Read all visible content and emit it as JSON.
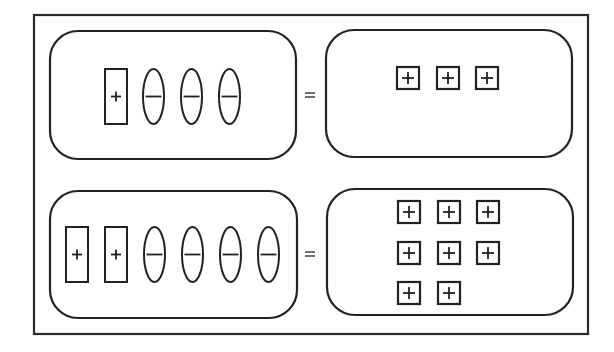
{
  "diagram": {
    "title": "",
    "colors": {
      "stroke": "#222222",
      "background": "#ffffff",
      "frame": "#2a2a2a"
    },
    "equals_symbol": "=",
    "frame": {
      "x": 34,
      "y": 15,
      "w": 554,
      "h": 319
    },
    "rows": [
      {
        "id": "row-1",
        "equation": "(+1) + (-1) + (-1) + (-1) = 3 units",
        "left_panel": {
          "x": 50,
          "y": 31,
          "w": 246,
          "h": 128,
          "r": 28
        },
        "equals": {
          "x": 310,
          "y": 95
        },
        "right_panel": {
          "x": 326,
          "y": 30,
          "w": 246,
          "h": 127,
          "r": 28
        },
        "left_tiles": [
          {
            "type": "rect",
            "sign": "+",
            "icon": "positive-long-tile-icon",
            "x": 105,
            "y": 69,
            "w": 22,
            "h": 55
          },
          {
            "type": "oval",
            "sign": "-",
            "icon": "negative-oval-tile-icon",
            "x": 143,
            "y": 69,
            "w": 21,
            "h": 55
          },
          {
            "type": "oval",
            "sign": "-",
            "icon": "negative-oval-tile-icon",
            "x": 181,
            "y": 69,
            "w": 21,
            "h": 55
          },
          {
            "type": "oval",
            "sign": "-",
            "icon": "negative-oval-tile-icon",
            "x": 219,
            "y": 69,
            "w": 21,
            "h": 55
          }
        ],
        "right_units": [
          {
            "sign": "+",
            "icon": "positive-unit-square-icon",
            "x": 397,
            "y": 67,
            "s": 22
          },
          {
            "sign": "+",
            "icon": "positive-unit-square-icon",
            "x": 437,
            "y": 67,
            "s": 22
          },
          {
            "sign": "+",
            "icon": "positive-unit-square-icon",
            "x": 476,
            "y": 67,
            "s": 22
          }
        ]
      },
      {
        "id": "row-2",
        "equation": "(+1) + (+1) + (-1) + (-1) + (-1) + (-1) = 8 units",
        "left_panel": {
          "x": 50,
          "y": 191,
          "w": 247,
          "h": 127,
          "r": 28
        },
        "equals": {
          "x": 310,
          "y": 254
        },
        "right_panel": {
          "x": 327,
          "y": 189,
          "w": 246,
          "h": 126,
          "r": 28
        },
        "left_tiles": [
          {
            "type": "rect",
            "sign": "+",
            "icon": "positive-long-tile-icon",
            "x": 66,
            "y": 227,
            "w": 22,
            "h": 55
          },
          {
            "type": "rect",
            "sign": "+",
            "icon": "positive-long-tile-icon",
            "x": 105,
            "y": 227,
            "w": 22,
            "h": 55
          },
          {
            "type": "oval",
            "sign": "-",
            "icon": "negative-oval-tile-icon",
            "x": 144,
            "y": 227,
            "w": 21,
            "h": 55
          },
          {
            "type": "oval",
            "sign": "-",
            "icon": "negative-oval-tile-icon",
            "x": 182,
            "y": 227,
            "w": 21,
            "h": 55
          },
          {
            "type": "oval",
            "sign": "-",
            "icon": "negative-oval-tile-icon",
            "x": 220,
            "y": 227,
            "w": 21,
            "h": 55
          },
          {
            "type": "oval",
            "sign": "-",
            "icon": "negative-oval-tile-icon",
            "x": 258,
            "y": 227,
            "w": 21,
            "h": 55
          }
        ],
        "right_units": [
          {
            "sign": "+",
            "icon": "positive-unit-square-icon",
            "x": 398,
            "y": 201,
            "s": 22
          },
          {
            "sign": "+",
            "icon": "positive-unit-square-icon",
            "x": 438,
            "y": 201,
            "s": 22
          },
          {
            "sign": "+",
            "icon": "positive-unit-square-icon",
            "x": 477,
            "y": 201,
            "s": 22
          },
          {
            "sign": "+",
            "icon": "positive-unit-square-icon",
            "x": 398,
            "y": 242,
            "s": 22
          },
          {
            "sign": "+",
            "icon": "positive-unit-square-icon",
            "x": 438,
            "y": 242,
            "s": 22
          },
          {
            "sign": "+",
            "icon": "positive-unit-square-icon",
            "x": 477,
            "y": 242,
            "s": 22
          },
          {
            "sign": "+",
            "icon": "positive-unit-square-icon",
            "x": 398,
            "y": 282,
            "s": 22
          },
          {
            "sign": "+",
            "icon": "positive-unit-square-icon",
            "x": 438,
            "y": 282,
            "s": 22
          }
        ]
      }
    ]
  }
}
